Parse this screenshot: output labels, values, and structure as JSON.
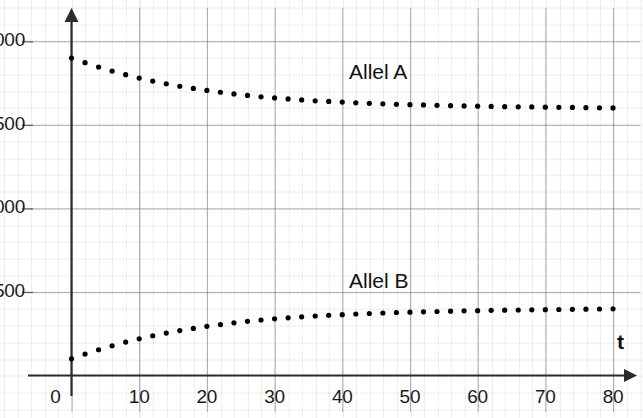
{
  "chart_data": {
    "type": "scatter",
    "title": "",
    "subtitle": "",
    "xlabel": "t",
    "ylabel": "",
    "xlim": [
      0,
      82
    ],
    "ylim": [
      0,
      2120
    ],
    "grid": true,
    "legend_position": "inline-annotation",
    "x_ticks": [
      0,
      10,
      20,
      30,
      40,
      50,
      60,
      70,
      80
    ],
    "x_tick_labels": [
      "0",
      "10",
      "20",
      "30",
      "40",
      "50",
      "60",
      "70",
      "80"
    ],
    "y_ticks": [
      500,
      1000,
      1500,
      2000
    ],
    "y_tick_labels": [
      "500",
      "1000",
      "1500",
      "2000"
    ],
    "marker": "dot",
    "marker_color": "#000000",
    "annotations": [
      {
        "text": "Allel A",
        "x": 41,
        "y": 1810
      },
      {
        "text": "Allel B",
        "x": 41,
        "y": 560
      }
    ],
    "x": [
      0,
      2,
      4,
      6,
      8,
      10,
      12,
      14,
      16,
      18,
      20,
      22,
      24,
      26,
      28,
      30,
      32,
      34,
      36,
      38,
      40,
      42,
      44,
      46,
      48,
      50,
      52,
      54,
      56,
      58,
      60,
      62,
      64,
      66,
      68,
      70,
      72,
      74,
      76,
      78,
      80
    ],
    "series": [
      {
        "name": "Allel A",
        "values": [
          1900,
          1872,
          1846,
          1822,
          1800,
          1780,
          1762,
          1746,
          1731,
          1718,
          1706,
          1695,
          1685,
          1676,
          1668,
          1661,
          1655,
          1649,
          1644,
          1640,
          1636,
          1632,
          1629,
          1626,
          1623,
          1621,
          1619,
          1617,
          1615,
          1613,
          1612,
          1610,
          1609,
          1608,
          1607,
          1606,
          1605,
          1604,
          1603,
          1602,
          1601
        ]
      },
      {
        "name": "Allel B",
        "values": [
          100,
          128,
          154,
          178,
          200,
          220,
          238,
          254,
          269,
          282,
          294,
          305,
          315,
          324,
          332,
          339,
          345,
          351,
          356,
          360,
          364,
          368,
          371,
          374,
          377,
          379,
          381,
          383,
          385,
          387,
          388,
          390,
          391,
          392,
          393,
          394,
          395,
          396,
          397,
          398,
          399
        ]
      }
    ]
  },
  "axes": {
    "x_axis_name": "t",
    "y_axis_name": ""
  }
}
